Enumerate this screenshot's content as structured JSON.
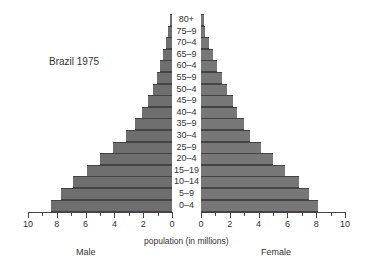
{
  "chart_data": {
    "type": "bar",
    "subtype": "population-pyramid",
    "title": "Brazil 1975",
    "xlabel": "population (in millions)",
    "ylabel": "",
    "categories": [
      "80+",
      "75–9",
      "70–4",
      "65–9",
      "60–4",
      "55–9",
      "50–4",
      "45–9",
      "40–4",
      "35–9",
      "30–4",
      "25–9",
      "20–4",
      "15–19",
      "10–14",
      "5–9",
      "0–4"
    ],
    "series": [
      {
        "name": "Male",
        "values": [
          0.15,
          0.25,
          0.4,
          0.6,
          0.8,
          1.05,
          1.35,
          1.7,
          2.1,
          2.6,
          3.2,
          4.1,
          5.0,
          5.9,
          6.9,
          7.7,
          8.4
        ]
      },
      {
        "name": "Female",
        "values": [
          0.2,
          0.3,
          0.55,
          0.8,
          1.1,
          1.45,
          1.8,
          2.2,
          2.5,
          3.0,
          3.4,
          4.2,
          5.0,
          5.8,
          6.8,
          7.5,
          8.1
        ]
      }
    ],
    "xlim": [
      0,
      10
    ],
    "xticks": [
      10,
      8,
      6,
      4,
      2,
      0
    ],
    "side_labels": {
      "left": "Male",
      "right": "Female"
    },
    "grid": false,
    "legend": "none"
  }
}
